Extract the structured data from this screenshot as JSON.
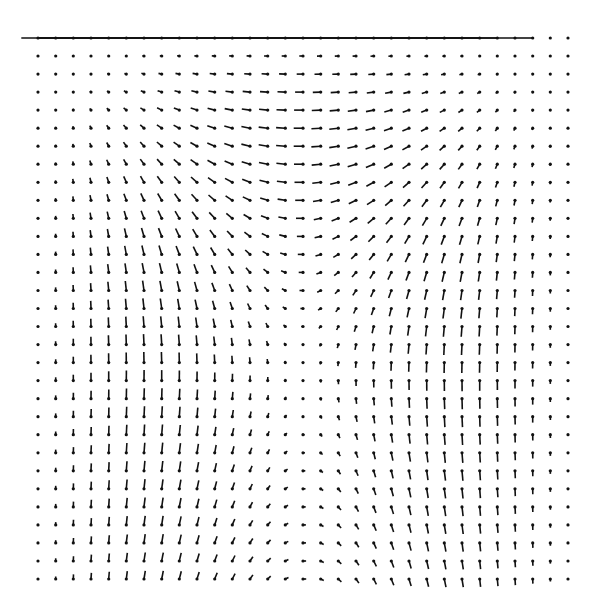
{
  "chart_data": {
    "type": "quiver",
    "title": "",
    "xlabel": "",
    "ylabel": "",
    "grid": {
      "cols": 31,
      "rows": 31,
      "x0": 38,
      "y0": 38,
      "x1": 568,
      "y1": 579
    },
    "vortex_center": {
      "col": 15,
      "row": 7
    },
    "lid_velocity": 1.0,
    "rotation": "clockwise",
    "arrow_scale": 52,
    "grid_on": false,
    "legend": null,
    "colors": {
      "arrow": "#111111",
      "background": "#ffffff"
    }
  }
}
